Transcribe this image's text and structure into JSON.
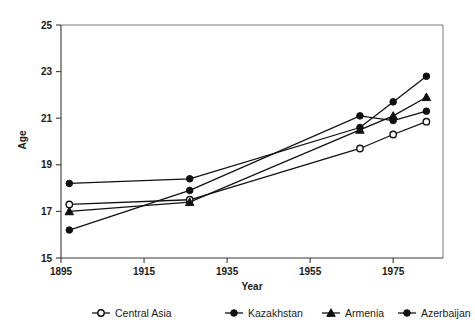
{
  "chart_data": {
    "type": "line",
    "title": "",
    "xlabel": "Year",
    "ylabel": "Age",
    "xlim": [
      1895,
      1987
    ],
    "ylim": [
      15,
      25
    ],
    "xticks": [
      1895,
      1915,
      1935,
      1955,
      1975
    ],
    "yticks": [
      15,
      17,
      19,
      21,
      23,
      25
    ],
    "grid": false,
    "legend_position": "bottom",
    "x": [
      1897,
      1926,
      1967,
      1975,
      1983
    ],
    "series": [
      {
        "name": "Central Asia",
        "marker": "open-circle",
        "values": [
          17.3,
          17.5,
          19.7,
          20.3,
          20.85
        ]
      },
      {
        "name": "Kazakhstan",
        "marker": "filled-circle",
        "values": [
          16.2,
          17.9,
          21.1,
          20.9,
          21.3
        ]
      },
      {
        "name": "Armenia",
        "marker": "filled-triangle",
        "values": [
          17.0,
          17.4,
          20.5,
          21.1,
          21.9
        ]
      },
      {
        "name": "Azerbaijan",
        "marker": "filled-circle",
        "values": [
          18.2,
          18.4,
          20.6,
          21.7,
          22.8
        ]
      }
    ]
  },
  "legend": {
    "items": [
      {
        "label": "Central Asia",
        "marker": "open-circle"
      },
      {
        "label": "Kazakhstan",
        "marker": "filled-circle"
      },
      {
        "label": "Armenia",
        "marker": "filled-triangle"
      },
      {
        "label": "Azerbaijan",
        "marker": "filled-circle"
      }
    ]
  },
  "axes": {
    "x_title": "Year",
    "y_title": "Age",
    "x_tick_labels": [
      "1895",
      "1915",
      "1935",
      "1955",
      "1975"
    ],
    "y_tick_labels": [
      "15",
      "17",
      "19",
      "21",
      "23",
      "25"
    ]
  }
}
